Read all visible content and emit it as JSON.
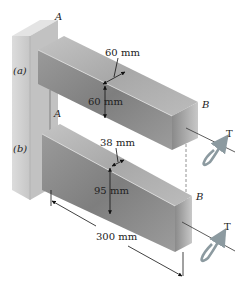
{
  "figure": {
    "type": "engineering-diagram",
    "colors": {
      "wall_front": "#d2d2d2",
      "wall_side": "#b8b8b8",
      "wall_top": "#e4e4e4",
      "bar_top": "#b4b4b4",
      "bar_side": "#8c8c8c",
      "bar_end": "#a0a0a0",
      "torque_arrow": "#8c9aa0",
      "dimension_line": "#111111"
    }
  },
  "labels": {
    "case_a": "(a)",
    "case_b": "(b)",
    "support_a_top": "A",
    "support_a_bottom": "A",
    "end_b_top": "B",
    "end_b_bottom": "B",
    "torque_top": "T",
    "torque_bottom": "T"
  },
  "dimensions": {
    "bar_a_width": "60 mm",
    "bar_a_height": "60 mm",
    "bar_b_width": "38 mm",
    "bar_b_height": "95 mm",
    "length": "300 mm"
  }
}
